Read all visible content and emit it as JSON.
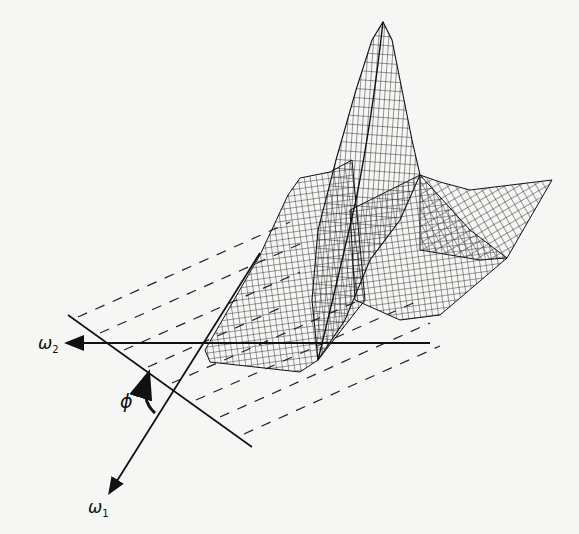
{
  "figure": {
    "type": "3d-wireframe-surface-with-projection",
    "labels": {
      "omega2": "ω",
      "omega2_sub": "2",
      "omega1": "ω",
      "omega1_sub": "1",
      "angle": "ϕ"
    },
    "colors": {
      "background": "#f6f6f4",
      "ink": "#111111"
    },
    "dashed_projection_lines": 8
  }
}
